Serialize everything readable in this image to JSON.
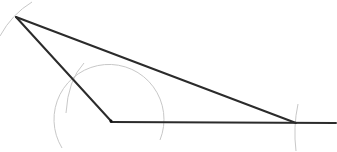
{
  "diagram": {
    "type": "geometric-construction",
    "background": "#ffffff",
    "line_color": "#2b2b2b",
    "arc_color": "#c8c8c8",
    "points": {
      "A": {
        "x": 16,
        "y": 17
      },
      "B": {
        "x": 111,
        "y": 121
      },
      "C": {
        "x": 296,
        "y": 123
      },
      "ray_end": {
        "x": 336,
        "y": 123
      }
    },
    "segments": [
      {
        "name": "segment-ab",
        "from": "A",
        "to": "B"
      },
      {
        "name": "segment-ac",
        "from": "A",
        "to": "C"
      },
      {
        "name": "ray-bc",
        "from": "B",
        "to": "ray_end"
      }
    ],
    "arcs": [
      {
        "name": "construction-arc-at-b",
        "path": "M 62 148 A 55 55 0 1 1 160 140"
      },
      {
        "name": "construction-arc-on-ab",
        "path": "M 66 113 Q 68 80 84 63"
      },
      {
        "name": "construction-arc-at-a",
        "path": "M 0 36 Q 12 14 32 2"
      },
      {
        "name": "construction-arc-at-c",
        "path": "M 298 104 Q 293 127 296 151"
      }
    ]
  }
}
